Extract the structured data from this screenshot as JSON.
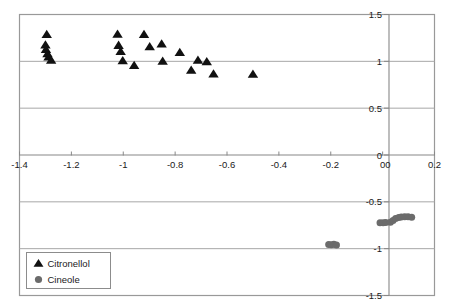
{
  "chart_data": {
    "type": "scatter",
    "title": "",
    "xlabel": "",
    "ylabel": "",
    "xlim": [
      -1.4,
      0.2
    ],
    "ylim": [
      -1.5,
      1.5
    ],
    "grid": true,
    "legend_position": "bottom-left",
    "x_ticks": [
      "-1.4",
      "-1.2",
      "-1",
      "-0.8",
      "-0.6",
      "-0.4",
      "-0.2",
      "0",
      "0.2"
    ],
    "x_tick_values": [
      -1.4,
      -1.2,
      -1,
      -0.8,
      -0.6,
      -0.4,
      -0.2,
      0,
      0.2
    ],
    "y_ticks": [
      "1.5",
      "1",
      "0.5",
      "0",
      "-0.5",
      "-1",
      "-1.5"
    ],
    "y_tick_values": [
      1.5,
      1,
      0.5,
      0,
      -0.5,
      -1,
      -1.5
    ],
    "axis_origin_label": "0",
    "series": [
      {
        "name": "Citronellol",
        "marker": "triangle",
        "color": "#111111",
        "points": [
          [
            -1.295,
            1.285
          ],
          [
            -1.3,
            1.175
          ],
          [
            -1.298,
            1.125
          ],
          [
            -1.292,
            1.08
          ],
          [
            -1.288,
            1.045
          ],
          [
            -1.278,
            1.012
          ],
          [
            -1.022,
            1.29
          ],
          [
            -1.018,
            1.17
          ],
          [
            -1.01,
            1.105
          ],
          [
            -1.002,
            1.005
          ],
          [
            -0.958,
            0.955
          ],
          [
            -0.92,
            1.285
          ],
          [
            -0.898,
            1.155
          ],
          [
            -0.852,
            1.185
          ],
          [
            -0.848,
            1.0
          ],
          [
            -0.782,
            1.095
          ],
          [
            -0.738,
            0.905
          ],
          [
            -0.712,
            1.01
          ],
          [
            -0.678,
            0.995
          ],
          [
            -0.652,
            0.865
          ],
          [
            -0.5,
            0.862
          ]
        ]
      },
      {
        "name": "Cineole",
        "marker": "circle",
        "color": "#6b6b6b",
        "points": [
          [
            -0.208,
            -0.955
          ],
          [
            -0.198,
            -0.958
          ],
          [
            -0.188,
            -0.952
          ],
          [
            -0.178,
            -0.96
          ],
          [
            -0.01,
            -0.722
          ],
          [
            0.002,
            -0.722
          ],
          [
            0.012,
            -0.72
          ],
          [
            0.03,
            -0.718
          ],
          [
            0.04,
            -0.7
          ],
          [
            0.05,
            -0.678
          ],
          [
            0.062,
            -0.668
          ],
          [
            0.072,
            -0.662
          ],
          [
            0.085,
            -0.66
          ],
          [
            0.098,
            -0.658
          ],
          [
            0.112,
            -0.665
          ]
        ]
      }
    ]
  },
  "legend": {
    "entries": [
      {
        "label": "Citronellol",
        "marker": "triangle"
      },
      {
        "label": "Cineole",
        "marker": "circle"
      }
    ]
  },
  "colors": {
    "citronellol": "#111111",
    "cineole": "#6b6b6b",
    "frame": "#999999",
    "grid": "#a8a8a8",
    "axis": "#888888",
    "text": "#1a1a1a"
  }
}
